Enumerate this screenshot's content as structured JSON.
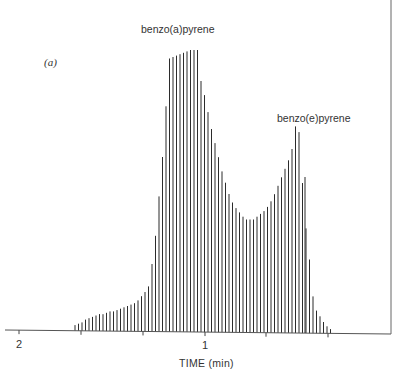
{
  "chart_data": {
    "type": "bar",
    "title": "",
    "panel_label": "(a)",
    "xlabel": "TIME (min)",
    "ylabel": "",
    "x_tick_labels": [
      {
        "label": "2",
        "x_px": 19
      },
      {
        "label": "",
        "x_px": 81
      },
      {
        "label": "",
        "x_px": 143
      },
      {
        "label": "1",
        "x_px": 205
      },
      {
        "label": "",
        "x_px": 266
      },
      {
        "label": "",
        "x_px": 328
      }
    ],
    "annotations": [
      {
        "text": "benzo(a)pyrene",
        "peak": 1
      },
      {
        "text": "benzo(e)pyrene",
        "peak": 2
      }
    ],
    "grid": false,
    "legend": null,
    "series": [
      {
        "name": "detector response",
        "bar_start_x_px": 75,
        "bar_step_px": 3.5,
        "values": [
          2,
          2.5,
          3,
          4,
          4.5,
          5,
          5.5,
          6,
          6,
          6.5,
          7,
          7,
          7.5,
          8,
          8.5,
          9,
          9.5,
          10,
          11,
          12.5,
          14,
          16,
          24,
          34,
          48,
          62,
          80,
          97,
          97.5,
          98,
          98.5,
          99,
          99.5,
          100,
          100,
          100,
          89,
          84,
          78,
          72,
          67,
          62,
          57,
          53,
          49,
          46,
          44,
          42.5,
          41,
          40,
          40,
          40,
          41,
          42,
          43,
          44.5,
          46.5,
          49,
          52,
          55,
          58,
          61,
          65,
          73,
          71,
          53,
          37,
          26,
          13,
          8,
          6,
          4,
          2.5,
          1.5
        ]
      }
    ]
  }
}
